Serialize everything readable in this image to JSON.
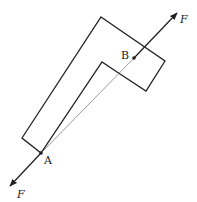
{
  "diagram": {
    "colors": {
      "stroke": "#222222",
      "background": "#ffffff",
      "thin_line": "#555555"
    },
    "shape_outline": [
      [
        101,
        17
      ],
      [
        165,
        61
      ],
      [
        146,
        91
      ],
      [
        117,
        72
      ],
      [
        102,
        62
      ],
      [
        46,
        150
      ],
      [
        41,
        153
      ],
      [
        22,
        138
      ]
    ],
    "points": {
      "A": {
        "label": "A",
        "x": 41,
        "y": 153
      },
      "B": {
        "label": "B",
        "x": 134,
        "y": 58
      }
    },
    "forces": [
      {
        "label": "F",
        "from": [
          134,
          58
        ],
        "to": [
          177,
          13
        ]
      },
      {
        "label": "F",
        "from": [
          41,
          153
        ],
        "to": [
          10,
          186
        ]
      }
    ]
  }
}
